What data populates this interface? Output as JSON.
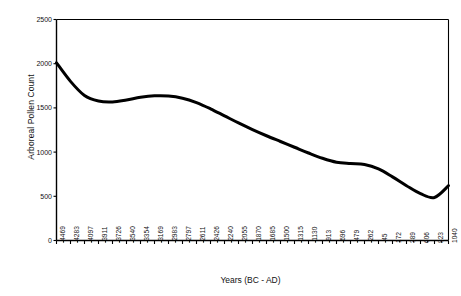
{
  "chart_data": {
    "type": "line",
    "title": "",
    "xlabel": "Years (BC - AD)",
    "ylabel": "Arboreal Pollen Count",
    "ylim": [
      0,
      2500
    ],
    "y_ticks": [
      0,
      500,
      1000,
      1500,
      2000,
      2500
    ],
    "y_tick_labels": [
      "0",
      "500",
      "1000",
      "1500",
      "2000",
      "2500"
    ],
    "grid": false,
    "legend": "none",
    "line_color": "#000000",
    "line_width": 3,
    "axis_color": "#000000",
    "background": "#ffffff",
    "categories": [
      "-4469",
      "-4283",
      "-4097",
      "-3911",
      "-3726",
      "-3540",
      "-3354",
      "-3169",
      "-2983",
      "-2797",
      "-2611",
      "-2426",
      "-2240",
      "-2055",
      "-1870",
      "-1685",
      "-1500",
      "-1315",
      "-1130",
      "-913",
      "-696",
      "-479",
      "-262",
      "-45",
      "172",
      "389",
      "606",
      "823",
      "1040"
    ],
    "values": [
      2010,
      1800,
      1640,
      1578,
      1568,
      1590,
      1620,
      1637,
      1635,
      1610,
      1560,
      1490,
      1410,
      1330,
      1255,
      1185,
      1120,
      1055,
      990,
      930,
      885,
      870,
      860,
      810,
      720,
      620,
      530,
      487,
      620
    ]
  }
}
